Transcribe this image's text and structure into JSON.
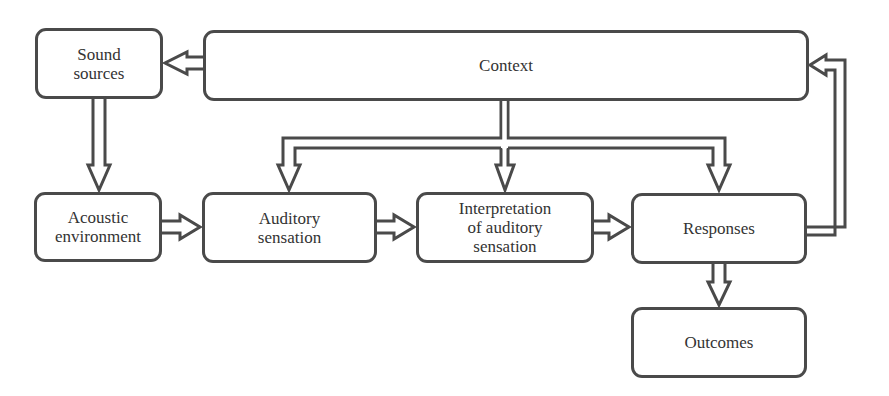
{
  "diagram": {
    "type": "flowchart",
    "colors": {
      "stroke": "#4a4a4a",
      "text": "#333333",
      "background": "#ffffff"
    },
    "nodes": {
      "sound_sources": {
        "lines": [
          "Sound",
          "sources"
        ]
      },
      "context": {
        "lines": [
          "Context"
        ]
      },
      "acoustic_environment": {
        "lines": [
          "Acoustic",
          "environment"
        ]
      },
      "auditory_sensation": {
        "lines": [
          "Auditory",
          "sensation"
        ]
      },
      "interpretation": {
        "lines": [
          "Interpretation",
          "of auditory",
          "sensation"
        ]
      },
      "responses": {
        "lines": [
          "Responses"
        ]
      },
      "outcomes": {
        "lines": [
          "Outcomes"
        ]
      }
    },
    "edges": [
      {
        "from": "Context",
        "to": "Sound sources"
      },
      {
        "from": "Sound sources",
        "to": "Acoustic environment"
      },
      {
        "from": "Acoustic environment",
        "to": "Auditory sensation"
      },
      {
        "from": "Auditory sensation",
        "to": "Interpretation of auditory sensation"
      },
      {
        "from": "Interpretation of auditory sensation",
        "to": "Responses"
      },
      {
        "from": "Context",
        "to": "Auditory sensation"
      },
      {
        "from": "Context",
        "to": "Interpretation of auditory sensation"
      },
      {
        "from": "Context",
        "to": "Responses"
      },
      {
        "from": "Responses",
        "to": "Outcomes"
      },
      {
        "from": "Responses",
        "to": "Context"
      }
    ]
  }
}
